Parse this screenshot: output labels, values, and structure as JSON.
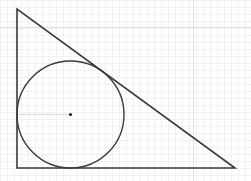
{
  "diagram": {
    "type": "geometry",
    "colors": {
      "stroke": "#3a3a3a",
      "grid_minor": "#f1f1f1",
      "grid_major": "#e2e2e2",
      "background": "#ffffff"
    },
    "triangle": {
      "vertices": [
        {
          "name": "top",
          "x": 17,
          "y": 9
        },
        {
          "name": "right-angle",
          "x": 17,
          "y": 168
        },
        {
          "name": "right",
          "x": 235,
          "y": 168
        }
      ]
    },
    "circle": {
      "cx": 70.5,
      "cy": 114.5,
      "r": 53.5
    },
    "center_point": {
      "x": 70.5,
      "y": 114.5
    },
    "radius_line": {
      "x1": 17,
      "y1": 114.5,
      "x2": 70.5,
      "y2": 114.5
    },
    "grid": {
      "minor_spacing": 7,
      "major_x": [
        193
      ],
      "major_y": [
        27
      ]
    }
  }
}
